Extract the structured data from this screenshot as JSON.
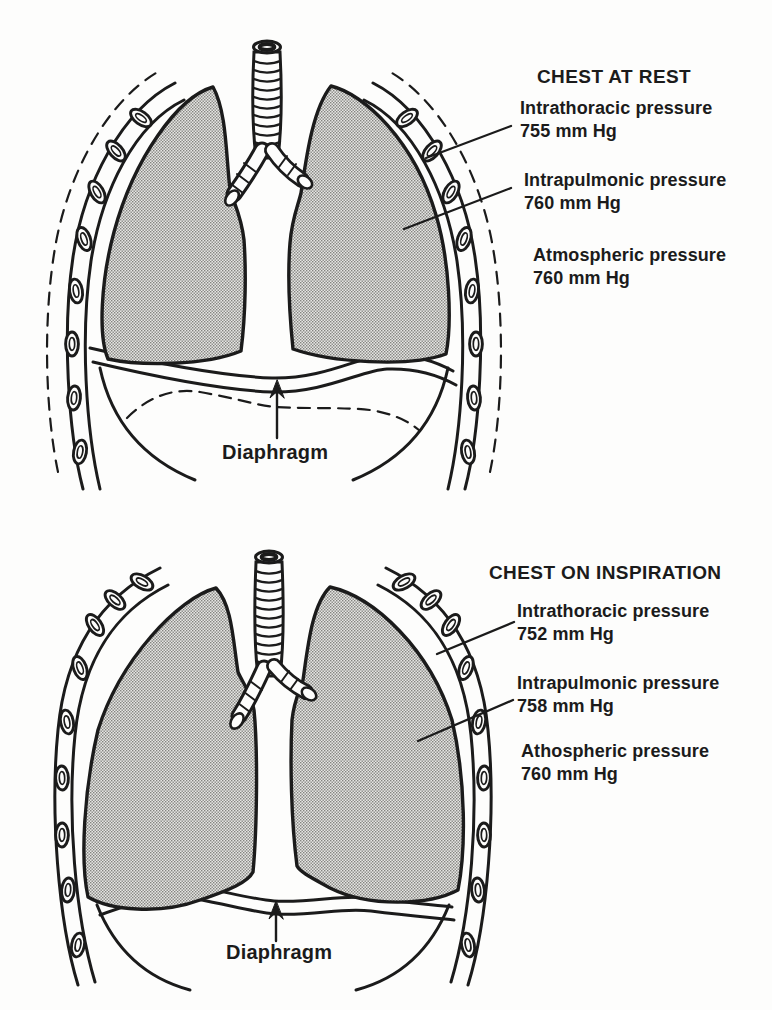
{
  "figure": {
    "background": "#fdfdfc",
    "ink": "#1b1b1b",
    "lung_stipple_average": "#bdbdbb"
  },
  "panels": [
    {
      "id": "chest-at-rest",
      "title": "CHEST AT REST",
      "labels": [
        {
          "name": "Intrathoracic pressure",
          "value": "755 mm Hg"
        },
        {
          "name": "Intrapulmonic pressure",
          "value": "760 mm Hg"
        },
        {
          "name": "Atmospheric pressure",
          "value": "760 mm Hg"
        }
      ],
      "diaphragm_label": "Diaphragm"
    },
    {
      "id": "chest-on-inspiration",
      "title": "CHEST ON INSPIRATION",
      "labels": [
        {
          "name": "Intrathoracic pressure",
          "value": "752 mm Hg"
        },
        {
          "name": "Intrapulmonic pressure",
          "value": "758 mm Hg"
        },
        {
          "name": "Athospheric pressure",
          "value": "760 mm Hg"
        }
      ],
      "diaphragm_label": "Diaphragm"
    }
  ]
}
